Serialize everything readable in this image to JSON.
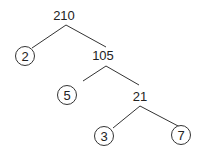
{
  "diagram": {
    "type": "factor-tree",
    "nodes": {
      "n210": {
        "label": "210",
        "prime": false
      },
      "n2": {
        "label": "2",
        "prime": true
      },
      "n105": {
        "label": "105",
        "prime": false
      },
      "n5": {
        "label": "5",
        "prime": true
      },
      "n21": {
        "label": "21",
        "prime": false
      },
      "n3": {
        "label": "3",
        "prime": true
      },
      "n7": {
        "label": "7",
        "prime": true
      }
    },
    "edges": [
      [
        "210",
        "2"
      ],
      [
        "210",
        "105"
      ],
      [
        "105",
        "5"
      ],
      [
        "105",
        "21"
      ],
      [
        "21",
        "3"
      ],
      [
        "21",
        "7"
      ]
    ]
  }
}
